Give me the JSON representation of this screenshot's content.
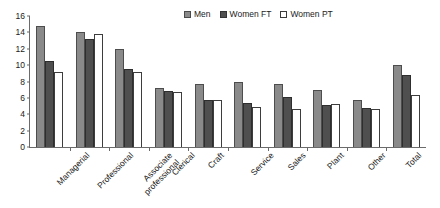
{
  "chart_data": {
    "type": "bar",
    "title": "",
    "subtitle": "",
    "xlabel": "",
    "ylabel": "",
    "ylim": [
      0,
      16
    ],
    "yticks": [
      0,
      2,
      4,
      6,
      8,
      10,
      12,
      14,
      16
    ],
    "grid": false,
    "legend_position": "top-right",
    "categories": [
      "Managerial",
      "Professional",
      "Associate\nprofessional",
      "Clerical",
      "Craft",
      "Service",
      "Sales",
      "Plant",
      "Other",
      "Total"
    ],
    "series": [
      {
        "name": "Men",
        "color": "#8a8a8a",
        "values": [
          14.8,
          14.1,
          12.0,
          7.2,
          7.7,
          7.9,
          7.7,
          7.0,
          5.8,
          10.0
        ]
      },
      {
        "name": "Women FT",
        "color": "#4f4f4f",
        "values": [
          10.5,
          13.2,
          9.5,
          6.9,
          5.7,
          5.4,
          6.1,
          5.1,
          4.8,
          8.8
        ]
      },
      {
        "name": "Women PT",
        "color": "#ffffff",
        "values": [
          9.2,
          13.8,
          9.2,
          6.7,
          5.7,
          4.9,
          4.6,
          5.3,
          4.7,
          6.4
        ]
      }
    ]
  },
  "legend": {
    "items": [
      {
        "label": "Men"
      },
      {
        "label": "Women FT"
      },
      {
        "label": "Women PT"
      }
    ]
  },
  "axis": {
    "y_tick_labels": [
      "16",
      "14",
      "12",
      "10",
      "8",
      "6",
      "4",
      "2",
      "0"
    ],
    "x_tick_labels": [
      "Managerial",
      "Professional",
      "Associate professional",
      "Clerical",
      "Craft",
      "Service",
      "Sales",
      "Plant",
      "Other",
      "Total"
    ]
  }
}
